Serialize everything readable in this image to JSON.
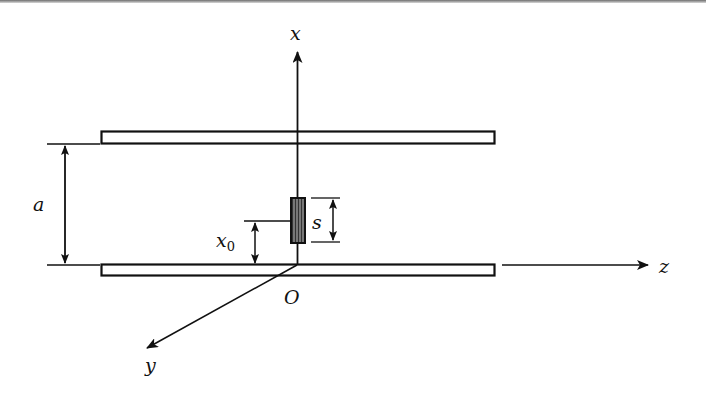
{
  "figure": {
    "type": "parallel-plate waveguide with probe",
    "axes": {
      "x_label": "x",
      "y_label": "y",
      "z_label": "z",
      "origin_label": "O"
    },
    "dimensions": {
      "plate_separation_label": "a",
      "probe_offset_label": "x",
      "probe_offset_subscript": "0",
      "probe_length_label": "s"
    },
    "colors": {
      "line": "#111111",
      "probe_fill": "#555555",
      "background": "#ffffff"
    }
  }
}
